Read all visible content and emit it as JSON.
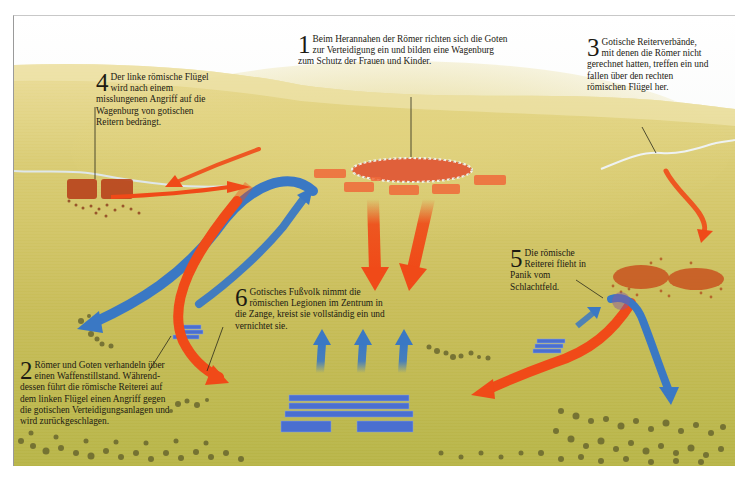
{
  "map": {
    "title": "Schlacht: Goten gegen Römer – Wagenburg",
    "colors": {
      "sky_top": "#ffffff",
      "sky_horizon": "#e9eef0",
      "terrain_light": "#e6d68a",
      "terrain_mid": "#c9bd5a",
      "terrain_dark": "#a9a83a",
      "goth_arrow": "#f04a18",
      "roman_arrow": "#3a78c4",
      "goth_troops": "#b8411c",
      "roman_troops": "#4a6fd0",
      "scrub": "#5a5a28",
      "river": "#dfe7ea",
      "leader_line": "#2a2a1a"
    },
    "legend_sides": [
      {
        "side": "Goten",
        "color": "#f04a18"
      },
      {
        "side": "Römer",
        "color": "#3a78c4"
      }
    ],
    "annotations": [
      {
        "id": "1",
        "number": "1",
        "text": "Beim Herannahen der Römer richten sich die Goten zur Verteidigung ein und bilden eine Wagenburg zum Schutz der Frauen und Kinder.",
        "left": 298,
        "top": 34,
        "width": 210
      },
      {
        "id": "2",
        "number": "2",
        "text": "Römer und Goten verhandeln über einen Waffenstillstand. Während-dessen führt die römische Reiterei auf dem linken Flügel einen Angriff gegen die gotischen Verteidigungsanlagen und wird zurückgeschlagen.",
        "left": 20,
        "top": 358,
        "width": 150
      },
      {
        "id": "3",
        "number": "3",
        "text": "Gotische Reiterverbände, mit denen die Römer nicht gerechnet hatten, treffen ein und fallen über den rechten römischen Flügel her.",
        "left": 549,
        "top": 35,
        "width": 120
      },
      {
        "id": "4",
        "number": "4",
        "text": "Der linke römische Flügel wird nach einem misslungenen Angriff auf die Wagenburg von gotischen Reitern bedrängt.",
        "left": 82,
        "top": 58,
        "width": 122
      },
      {
        "id": "5",
        "number": "5",
        "text": "Die römische Reiterei flieht in Panik vom Schlachtfeld.",
        "left": 498,
        "top": 232,
        "width": 80
      },
      {
        "id": "6",
        "number": "6",
        "text": "Gotisches Fußvolk nimmt die römischen Legionen im Zentrum in die Zange, kreist sie vollständig ein und vernichtet sie.",
        "left": 222,
        "top": 273,
        "width": 150
      }
    ]
  }
}
